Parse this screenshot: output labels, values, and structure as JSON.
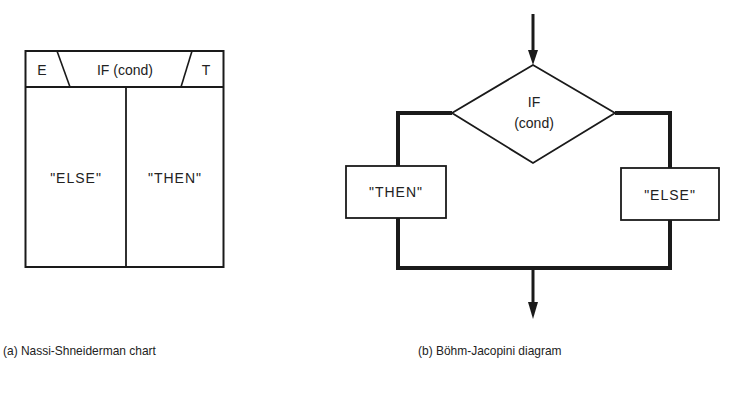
{
  "nassi_shneiderman": {
    "header": {
      "else_marker": "E",
      "condition": "IF (cond)",
      "then_marker": "T"
    },
    "else_branch": "\"ELSE\"",
    "then_branch": "\"THEN\"",
    "caption": "(a)  Nassi-Shneiderman chart"
  },
  "bohm_jacopini": {
    "decision_line1": "IF",
    "decision_line2": "(cond)",
    "then_box": "\"THEN\"",
    "else_box": "\"ELSE\"",
    "caption": "(b)  Böhm-Jacopini diagram"
  }
}
